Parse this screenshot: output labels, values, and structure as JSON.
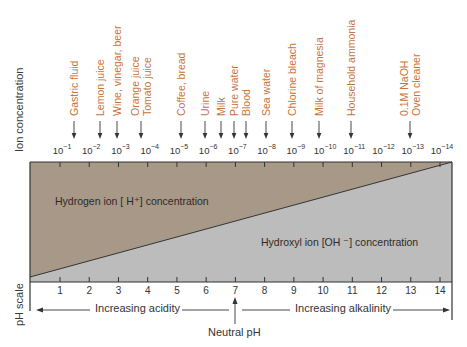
{
  "diagram": {
    "y_axis_label_top": "Ion concentration",
    "y_axis_label_bottom": "pH scale",
    "colors": {
      "hydrogen_region": "#a89888",
      "hydroxyl_region": "#bcbcbc",
      "substance_label": "#c8743a",
      "lines": "#333333"
    },
    "concentration_ticks": [
      {
        "base": "10",
        "exp": "−1"
      },
      {
        "base": "10",
        "exp": "−2"
      },
      {
        "base": "10",
        "exp": "−3"
      },
      {
        "base": "10",
        "exp": "−4"
      },
      {
        "base": "10",
        "exp": "−5"
      },
      {
        "base": "10",
        "exp": "−6"
      },
      {
        "base": "10",
        "exp": "−7"
      },
      {
        "base": "10",
        "exp": "−8"
      },
      {
        "base": "10",
        "exp": "−9"
      },
      {
        "base": "10",
        "exp": "−10"
      },
      {
        "base": "10",
        "exp": "−11"
      },
      {
        "base": "10",
        "exp": "−12"
      },
      {
        "base": "10",
        "exp": "−13"
      },
      {
        "base": "10",
        "exp": "−14"
      }
    ],
    "ph_ticks": [
      "1",
      "2",
      "3",
      "4",
      "5",
      "6",
      "7",
      "8",
      "9",
      "10",
      "11",
      "12",
      "13",
      "14"
    ],
    "substances": [
      {
        "lines": [
          "Gastric fluid"
        ],
        "ph": 1.5
      },
      {
        "lines": [
          "Lemon juice"
        ],
        "ph": 2.4
      },
      {
        "lines": [
          "Wine, vinegar, beer"
        ],
        "ph": 3.0
      },
      {
        "lines": [
          "Orange juice",
          "Tomato juice"
        ],
        "ph": 3.8
      },
      {
        "lines": [
          "Coffee, bread"
        ],
        "ph": 5.2
      },
      {
        "lines": [
          "Urine"
        ],
        "ph": 6.0
      },
      {
        "lines": [
          "Milk"
        ],
        "ph": 6.6
      },
      {
        "lines": [
          "Pure water"
        ],
        "ph": 7.0
      },
      {
        "lines": [
          "Blood"
        ],
        "ph": 7.4
      },
      {
        "lines": [
          "Sea water"
        ],
        "ph": 8.1
      },
      {
        "lines": [
          "Chlorine bleach"
        ],
        "ph": 9.0
      },
      {
        "lines": [
          "Milk of magnesia"
        ],
        "ph": 9.9
      },
      {
        "lines": [
          "Household ammonia"
        ],
        "ph": 11.0
      },
      {
        "lines": [
          "0.1M NaOH",
          "Oven cleaner"
        ],
        "ph": 13.0
      }
    ],
    "hydrogen_label": "Hydrogen ion [ H⁺] concentration",
    "hydroxyl_label": "Hydroxyl ion [OH ⁻] concentration",
    "increasing_acidity": "Increasing acidity",
    "increasing_alkalinity": "Increasing alkalinity",
    "neutral_label": "Neutral pH"
  }
}
